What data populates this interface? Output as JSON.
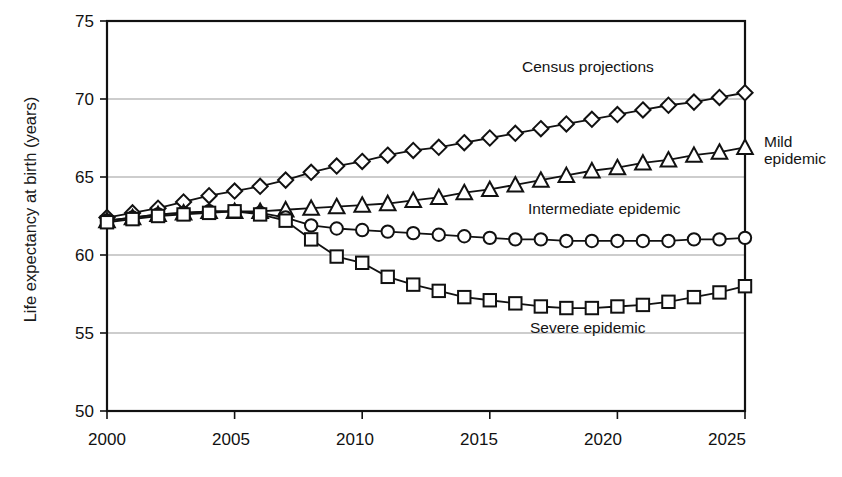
{
  "chart_data": {
    "type": "line",
    "title": "",
    "xlabel": "",
    "ylabel": "Life expectancy at birth (years)",
    "xlim": [
      2000,
      2025
    ],
    "ylim": [
      50,
      75
    ],
    "xticks": [
      "2000",
      "2005",
      "2010",
      "2015",
      "2020",
      "2025"
    ],
    "yticks": [
      "50",
      "55",
      "60",
      "65",
      "70",
      "75"
    ],
    "grid": "horizontal",
    "legend_position": "inline-annotations",
    "x": [
      2000,
      2001,
      2002,
      2003,
      2004,
      2005,
      2006,
      2007,
      2008,
      2009,
      2010,
      2011,
      2012,
      2013,
      2014,
      2015,
      2016,
      2017,
      2018,
      2019,
      2020,
      2021,
      2022,
      2023,
      2024,
      2025
    ],
    "series": [
      {
        "name": "Census projections",
        "marker": "diamond",
        "values": [
          62.4,
          62.7,
          63.0,
          63.4,
          63.8,
          64.1,
          64.4,
          64.8,
          65.3,
          65.7,
          66.0,
          66.4,
          66.7,
          66.9,
          67.2,
          67.5,
          67.8,
          68.1,
          68.4,
          68.7,
          69.0,
          69.3,
          69.6,
          69.8,
          70.1,
          70.4
        ]
      },
      {
        "name": "Mild epidemic",
        "marker": "triangle",
        "values": [
          62.2,
          62.4,
          62.6,
          62.7,
          62.8,
          62.8,
          62.8,
          62.9,
          63.0,
          63.1,
          63.2,
          63.3,
          63.5,
          63.7,
          64.0,
          64.2,
          64.5,
          64.8,
          65.1,
          65.4,
          65.6,
          65.9,
          66.1,
          66.4,
          66.6,
          66.9
        ]
      },
      {
        "name": "Intermediate epidemic",
        "marker": "circle",
        "values": [
          62.2,
          62.4,
          62.6,
          62.7,
          62.8,
          62.8,
          62.7,
          62.4,
          61.9,
          61.7,
          61.6,
          61.5,
          61.4,
          61.3,
          61.2,
          61.1,
          61.0,
          61.0,
          60.9,
          60.9,
          60.9,
          60.9,
          60.9,
          61.0,
          61.0,
          61.1
        ]
      },
      {
        "name": "Severe epidemic",
        "marker": "square",
        "values": [
          62.1,
          62.3,
          62.5,
          62.6,
          62.7,
          62.8,
          62.6,
          62.2,
          61.0,
          59.9,
          59.5,
          58.6,
          58.1,
          57.7,
          57.3,
          57.1,
          56.9,
          56.7,
          56.6,
          56.6,
          56.7,
          56.8,
          57.0,
          57.3,
          57.6,
          58.0
        ]
      }
    ],
    "annotations": [
      {
        "text": "Census  projections",
        "series": "Census projections",
        "x": 2018,
        "y": 71.6
      },
      {
        "text": "Mild",
        "text2": "epidemic",
        "series": "Mild epidemic",
        "x": 2025.4,
        "y": 67.7
      },
      {
        "text": "Intermediate epidemic",
        "series": "Intermediate epidemic",
        "x": 2019,
        "y": 62.3
      },
      {
        "text": "Severe epidemic",
        "series": "Severe epidemic",
        "x": 2020,
        "y": 55.5
      }
    ]
  },
  "axis": {
    "y_title": "Life expectancy at birth (years)",
    "y_ticks": [
      "75",
      "70",
      "65",
      "60",
      "55",
      "50"
    ],
    "x_ticks": [
      "2000",
      "2005",
      "2010",
      "2015",
      "2020",
      "2025"
    ]
  },
  "labels": {
    "census": "Census  projections",
    "mild_line1": "Mild",
    "mild_line2": "epidemic",
    "intermediate": "Intermediate epidemic",
    "severe": "Severe epidemic"
  },
  "colors": {
    "ink": "#111111",
    "grid": "#9b9b9b",
    "background": "#ffffff"
  },
  "faint_title": ""
}
